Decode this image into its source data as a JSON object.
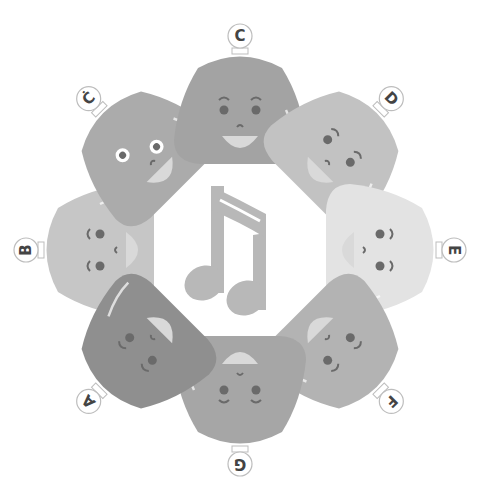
{
  "title": "Solfege bell characters arranged around a music note",
  "colors": {
    "background": "#ffffff",
    "note": "#b8b8b8",
    "label_text": "#444444",
    "label_ring": "#bdbdbd",
    "features": "#6a6a6a",
    "mouth": "#d9d9d9"
  },
  "center_icon": "beamed-eighth-notes-icon",
  "characters": [
    {
      "label": "C",
      "angle": 0,
      "shade": "#a3a3a3",
      "expression": "smiling"
    },
    {
      "label": "D",
      "angle": 45,
      "shade": "#c2c2c2",
      "expression": "smiling"
    },
    {
      "label": "E",
      "angle": 90,
      "shade": "#e3e3e3",
      "expression": "smiling"
    },
    {
      "label": "F",
      "angle": 135,
      "shade": "#b3b3b3",
      "expression": "smiling"
    },
    {
      "label": "G",
      "angle": 180,
      "shade": "#a6a6a6",
      "expression": "smiling"
    },
    {
      "label": "A",
      "angle": 225,
      "shade": "#8f8f8f",
      "expression": "smiling"
    },
    {
      "label": "B",
      "angle": 270,
      "shade": "#c6c6c6",
      "expression": "smiling"
    },
    {
      "label": "Ċ",
      "angle": 315,
      "shade": "#ababab",
      "expression": "excited"
    }
  ]
}
